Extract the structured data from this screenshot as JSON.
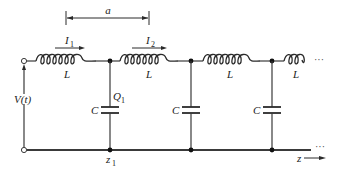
{
  "diagram": {
    "type": "transmission-line-ladder-circuit",
    "dimension_label": "a",
    "source_label": "V(t)",
    "inductor_label": "L",
    "capacitor_label": "C",
    "currents": [
      {
        "symbol": "I",
        "subscript": "1"
      },
      {
        "symbol": "I",
        "subscript": "2"
      }
    ],
    "charge": {
      "symbol": "Q",
      "subscript": "1"
    },
    "position": {
      "symbol": "z",
      "subscript": "1"
    },
    "axis_label": "z",
    "continuation": "···",
    "inductor_count": 4,
    "capacitor_count": 3
  }
}
